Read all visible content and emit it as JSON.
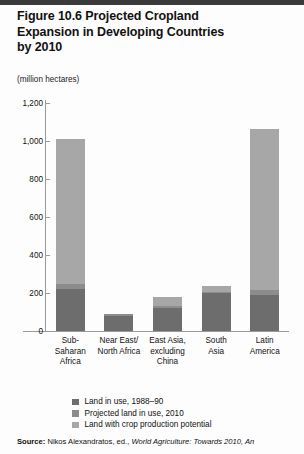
{
  "figure": {
    "title": "Figure 10.6  Projected Cropland Expansion in Developing Countries by 2010",
    "title_line1": "Figure 10.6  Projected Cropland",
    "title_line2": "Expansion in Developing Countries",
    "title_line3": "by 2010",
    "units_note": "(million hectares)"
  },
  "source": {
    "label": "Source:",
    "text_part1": " Nikos Alexandratos, ed., ",
    "italic_part": "World Agriculture: Towards 2010, An"
  },
  "legend": {
    "position": "below-axis",
    "items": [
      {
        "label": "Land in use, 1988–90",
        "color": "#6d6d6d",
        "swatch_name": "legend-swatch-land-in-use"
      },
      {
        "label": "Projected land in use, 2010",
        "color": "#8c8c8c",
        "swatch_name": "legend-swatch-projected-land"
      },
      {
        "label": "Land with crop production potential",
        "color": "#a7a7a7",
        "swatch_name": "legend-swatch-crop-potential"
      }
    ]
  },
  "chart_data": {
    "type": "bar",
    "stacked": true,
    "title": "Figure 10.6  Projected Cropland Expansion in Developing Countries by 2010",
    "xlabel": "",
    "ylabel": "(million hectares)",
    "ylim": [
      0,
      1200
    ],
    "yticks": [
      0,
      200,
      400,
      600,
      800,
      1000,
      1200
    ],
    "ytick_labels": [
      "0",
      "200",
      "400",
      "600",
      "800",
      "1,000",
      "1,200"
    ],
    "grid": false,
    "categories": [
      "Sub-Saharan Africa",
      "Near East/ North Africa",
      "East Asia, excluding China",
      "South Asia",
      "Latin America"
    ],
    "category_label_lines": [
      [
        "Sub-",
        "Saharan",
        "Africa"
      ],
      [
        "Near East/",
        "North Africa"
      ],
      [
        "East Asia,",
        "excluding",
        "China"
      ],
      [
        "South",
        "Asia"
      ],
      [
        "Latin",
        "America"
      ]
    ],
    "series": [
      {
        "name": "Land in use, 1988–90",
        "color": "#6d6d6d",
        "values": [
          222,
          80,
          122,
          198,
          192
        ]
      },
      {
        "name": "Projected land in use, 2010",
        "color": "#8c8c8c",
        "values": [
          250,
          88,
          133,
          205,
          215
        ]
      },
      {
        "name": "Land with crop production potential",
        "color": "#a7a7a7",
        "values": [
          1010,
          90,
          180,
          237,
          1065
        ]
      }
    ],
    "cumulative_tops": {
      "note": "series values are cumulative stacked tops in million hectares"
    }
  }
}
